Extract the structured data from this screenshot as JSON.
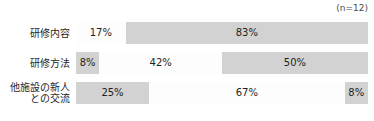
{
  "chart_data": {
    "type": "bar",
    "orientation": "horizontal",
    "stacked": true,
    "normalized_percent": true,
    "title": "",
    "subtitle": "",
    "xlabel": "",
    "ylabel": "",
    "xlim": [
      0,
      100
    ],
    "grid": false,
    "legend": false,
    "annotation": "(n=12)",
    "categories": [
      "研修内容",
      "研修方法",
      "他施設の新人\nとの交流"
    ],
    "rows": [
      {
        "label_lines": [
          "研修内容"
        ],
        "segments": [
          {
            "value": 17,
            "label": "17%",
            "fill": "white"
          },
          {
            "value": 83,
            "label": "83%",
            "fill": "gray"
          }
        ]
      },
      {
        "label_lines": [
          "研修方法"
        ],
        "segments": [
          {
            "value": 8,
            "label": "8%",
            "fill": "gray"
          },
          {
            "value": 42,
            "label": "42%",
            "fill": "white"
          },
          {
            "value": 50,
            "label": "50%",
            "fill": "gray"
          }
        ]
      },
      {
        "label_lines": [
          "他施設の新人",
          "との交流"
        ],
        "segments": [
          {
            "value": 25,
            "label": "25%",
            "fill": "gray"
          },
          {
            "value": 67,
            "label": "67%",
            "fill": "white"
          },
          {
            "value": 8,
            "label": "8%",
            "fill": "gray"
          }
        ]
      }
    ],
    "colors": {
      "gray": "#d2d2d2",
      "white": "#fdfdfd",
      "text": "#1f1f1f",
      "background": "#ffffff"
    }
  }
}
